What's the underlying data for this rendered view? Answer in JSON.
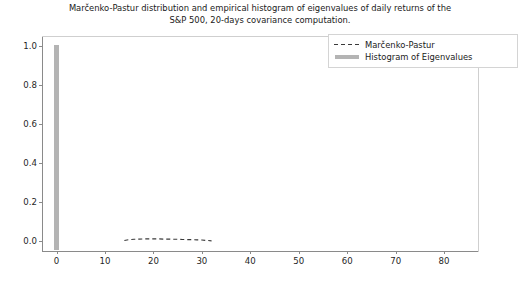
{
  "chart_data": {
    "type": "bar",
    "title": "Marčenko-Pastur distribution and empirical histogram of eigenvalues of daily returns of the\nS&P 500, 20-days covariance computation.",
    "xlabel": "",
    "ylabel": "",
    "xlim": [
      -3,
      87
    ],
    "ylim": [
      -0.05,
      1.05
    ],
    "grid": false,
    "legend_position": "upper right",
    "xticks": [
      0,
      10,
      20,
      30,
      40,
      50,
      60,
      70,
      80
    ],
    "xtick_labels": [
      "0",
      "10",
      "20",
      "30",
      "40",
      "50",
      "60",
      "70",
      "80"
    ],
    "yticks": [
      0.0,
      0.2,
      0.4,
      0.6,
      0.8,
      1.0
    ],
    "ytick_labels": [
      "0.0",
      "0.2",
      "0.4",
      "0.6",
      "0.8",
      "1.0"
    ],
    "series": [
      {
        "name": "Marčenko-Pastur",
        "type": "line",
        "style": "dashed",
        "color": "#3a3a3a",
        "x": [
          14.0,
          15.0,
          16.0,
          17.0,
          18.0,
          19.0,
          20.0,
          21.0,
          22.0,
          23.0,
          24.0,
          25.0,
          26.0,
          27.0,
          28.0,
          29.0,
          30.0,
          31.0,
          32.0
        ],
        "values": [
          0.004,
          0.008,
          0.01,
          0.011,
          0.012,
          0.012,
          0.012,
          0.012,
          0.011,
          0.011,
          0.01,
          0.01,
          0.009,
          0.008,
          0.008,
          0.007,
          0.006,
          0.004,
          0.002
        ]
      },
      {
        "name": "Histogram of Eigenvalues",
        "type": "bar",
        "color": "#b4b4b4",
        "bar_width": 0.9,
        "x": [
          0.0
        ],
        "values": [
          1.0
        ]
      }
    ],
    "legend_entries": [
      {
        "label": "Marčenko-Pastur",
        "key": "dashed-line"
      },
      {
        "label": "Histogram of Eigenvalues",
        "key": "filled-bar"
      }
    ]
  }
}
